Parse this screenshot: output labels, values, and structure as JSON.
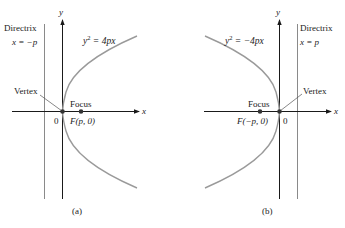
{
  "colors": {
    "axis": "#1a1a1a",
    "curve": "#9a9a9a",
    "directrix": "#8a8a8a",
    "point": "#333333",
    "text": "#222222"
  },
  "panel_a": {
    "caption": "(a)",
    "directrix_title": "Directrix",
    "directrix_eq": "x = −p",
    "equation_lhs": "y",
    "equation_exp": "2",
    "equation_rhs": " = 4px",
    "vertex_label": "Vertex",
    "focus_label": "Focus",
    "focus_coord": "F(p, 0)",
    "origin_label": "0",
    "x_axis_label": "x",
    "y_axis_label": "y"
  },
  "panel_b": {
    "caption": "(b)",
    "directrix_title": "Directrix",
    "directrix_eq": "x = p",
    "equation_lhs": "y",
    "equation_exp": "2",
    "equation_rhs": " = −4px",
    "vertex_label": "Vertex",
    "focus_label": "Focus",
    "focus_coord": "F(−p, 0)",
    "origin_label": "0",
    "x_axis_label": "x",
    "y_axis_label": "y"
  }
}
